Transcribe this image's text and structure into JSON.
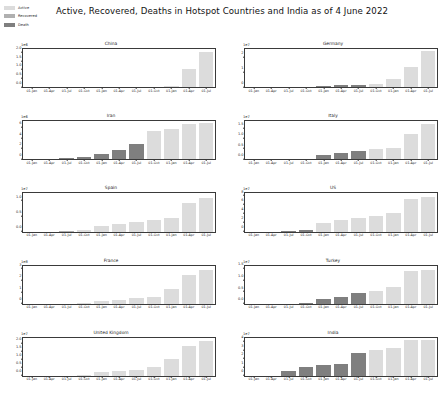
{
  "figure": {
    "title": "Active, Recovered, Deaths in Hotspot Countries and India as of 4 June 2022",
    "legend": [
      {
        "label": "Active",
        "color": "#dcdcdc",
        "name": "legend-active"
      },
      {
        "label": "Recovered",
        "color": "#b0b0b0",
        "name": "legend-recovered"
      },
      {
        "label": "Death",
        "color": "#7f7f7f",
        "name": "legend-death"
      }
    ],
    "layout": {
      "rows": 5,
      "cols": 2,
      "grid": false
    }
  },
  "chart_data": [
    {
      "type": "bar",
      "title": "China",
      "xlabel": "",
      "ylabel": "",
      "exponent": "1e6",
      "ylim": [
        0,
        2.2
      ],
      "yticks": [
        "0.0",
        "0.5",
        "1.0",
        "1.5",
        "2.0"
      ],
      "ytick_values": [
        0.0,
        0.5,
        1.0,
        1.5,
        2.0
      ],
      "x": [
        "01-Jan",
        "01-Apr",
        "01-Jul",
        "01-Oct",
        "01-Jan",
        "01-Apr",
        "01-Jul",
        "01-Oct",
        "01-Jan",
        "01-Apr",
        "01-Jul"
      ],
      "values": [
        0.01,
        0.02,
        0.02,
        0.03,
        0.03,
        0.03,
        0.04,
        0.04,
        0.05,
        1.05,
        2.05
      ],
      "colors": [
        "#b0b0b0",
        "#b0b0b0",
        "#b0b0b0",
        "#b0b0b0",
        "#b0b0b0",
        "#b0b0b0",
        "#b0b0b0",
        "#b0b0b0",
        "#dcdcdc",
        "#dcdcdc",
        "#dcdcdc"
      ]
    },
    {
      "type": "bar",
      "title": "Germany",
      "xlabel": "",
      "ylabel": "",
      "exponent": "1e7",
      "ylim": [
        0,
        2.6
      ],
      "yticks": [
        "0",
        "1",
        "2"
      ],
      "ytick_values": [
        0,
        1,
        2
      ],
      "x": [
        "01-Jan",
        "01-Apr",
        "01-Jul",
        "01-Oct",
        "01-Jan",
        "01-Apr",
        "01-Jul",
        "01-Oct",
        "01-Jan",
        "01-Apr",
        "01-Jul"
      ],
      "values": [
        0.0,
        0.0,
        0.01,
        0.02,
        0.08,
        0.12,
        0.18,
        0.25,
        0.55,
        1.35,
        2.45
      ],
      "colors": [
        "#b0b0b0",
        "#b0b0b0",
        "#b0b0b0",
        "#7f7f7f",
        "#7f7f7f",
        "#7f7f7f",
        "#7f7f7f",
        "#dcdcdc",
        "#dcdcdc",
        "#dcdcdc",
        "#dcdcdc"
      ]
    },
    {
      "type": "bar",
      "title": "Iran",
      "xlabel": "",
      "ylabel": "",
      "exponent": "1e6",
      "ylim": [
        0,
        7.2
      ],
      "yticks": [
        "0",
        "2",
        "4",
        "6"
      ],
      "ytick_values": [
        0,
        2,
        4,
        6
      ],
      "x": [
        "01-Jan",
        "01-Apr",
        "01-Jul",
        "01-Oct",
        "01-Jan",
        "01-Apr",
        "01-Jul",
        "01-Oct",
        "01-Jan",
        "01-Apr",
        "01-Jul"
      ],
      "values": [
        0.0,
        0.05,
        0.2,
        0.45,
        1.1,
        1.8,
        2.9,
        5.3,
        5.7,
        6.6,
        6.8
      ],
      "colors": [
        "#b0b0b0",
        "#7f7f7f",
        "#7f7f7f",
        "#7f7f7f",
        "#7f7f7f",
        "#7f7f7f",
        "#7f7f7f",
        "#dcdcdc",
        "#dcdcdc",
        "#dcdcdc",
        "#dcdcdc"
      ]
    },
    {
      "type": "bar",
      "title": "Italy",
      "xlabel": "",
      "ylabel": "",
      "exponent": "1e7",
      "ylim": [
        0,
        1.85
      ],
      "yticks": [
        "0.0",
        "0.5",
        "1.0",
        "1.5"
      ],
      "ytick_values": [
        0.0,
        0.5,
        1.0,
        1.5
      ],
      "x": [
        "01-Jan",
        "01-Apr",
        "01-Jul",
        "01-Oct",
        "01-Jan",
        "01-Apr",
        "01-Jul",
        "01-Oct",
        "01-Jan",
        "01-Apr",
        "01-Jul"
      ],
      "values": [
        0.0,
        0.0,
        0.01,
        0.03,
        0.22,
        0.33,
        0.42,
        0.5,
        0.55,
        1.25,
        1.7
      ],
      "colors": [
        "#b0b0b0",
        "#b0b0b0",
        "#b0b0b0",
        "#7f7f7f",
        "#7f7f7f",
        "#7f7f7f",
        "#7f7f7f",
        "#dcdcdc",
        "#dcdcdc",
        "#dcdcdc",
        "#dcdcdc"
      ]
    },
    {
      "type": "bar",
      "title": "Spain",
      "xlabel": "",
      "ylabel": "",
      "exponent": "1e7",
      "ylim": [
        0,
        1.25
      ],
      "yticks": [
        "0.0",
        "0.5",
        "1.0"
      ],
      "ytick_values": [
        0.0,
        0.5,
        1.0
      ],
      "x": [
        "01-Jan",
        "01-Apr",
        "01-Jul",
        "01-Oct",
        "01-Jan",
        "01-Apr",
        "01-Jul",
        "01-Oct",
        "01-Jan",
        "01-Apr",
        "01-Jul"
      ],
      "values": [
        0.0,
        0.0,
        0.01,
        0.06,
        0.17,
        0.24,
        0.3,
        0.38,
        0.43,
        0.95,
        1.1
      ],
      "colors": [
        "#b0b0b0",
        "#b0b0b0",
        "#b0b0b0",
        "#dcdcdc",
        "#dcdcdc",
        "#dcdcdc",
        "#dcdcdc",
        "#dcdcdc",
        "#dcdcdc",
        "#dcdcdc",
        "#dcdcdc"
      ]
    },
    {
      "type": "bar",
      "title": "US",
      "xlabel": "",
      "ylabel": "",
      "exponent": "1e7",
      "ylim": [
        0,
        8.6
      ],
      "yticks": [
        "0",
        "2",
        "4",
        "6",
        "8"
      ],
      "ytick_values": [
        0,
        2,
        4,
        6,
        8
      ],
      "x": [
        "01-Jan",
        "01-Apr",
        "01-Jul",
        "01-Oct",
        "01-Jan",
        "01-Apr",
        "01-Jul",
        "01-Oct",
        "01-Jan",
        "01-Apr",
        "01-Jul"
      ],
      "values": [
        0.0,
        0.0,
        0.1,
        0.25,
        1.9,
        2.7,
        3.1,
        3.6,
        4.1,
        7.3,
        7.9
      ],
      "colors": [
        "#b0b0b0",
        "#b0b0b0",
        "#7f7f7f",
        "#7f7f7f",
        "#dcdcdc",
        "#dcdcdc",
        "#dcdcdc",
        "#dcdcdc",
        "#dcdcdc",
        "#dcdcdc",
        "#dcdcdc"
      ]
    },
    {
      "type": "bar",
      "title": "France",
      "xlabel": "",
      "ylabel": "",
      "exponent": "1e8",
      "ylim": [
        0,
        3.3
      ],
      "yticks": [
        "0",
        "1",
        "2",
        "3"
      ],
      "ytick_values": [
        0,
        1,
        2,
        3
      ],
      "x": [
        "01-Jan",
        "01-Apr",
        "01-Jul",
        "01-Oct",
        "01-Jan",
        "01-Apr",
        "01-Jul",
        "01-Oct",
        "01-Jan",
        "01-Apr",
        "01-Jul"
      ],
      "values": [
        0.0,
        0.0,
        0.01,
        0.03,
        0.2,
        0.35,
        0.5,
        0.62,
        1.3,
        2.5,
        2.9
      ],
      "colors": [
        "#b0b0b0",
        "#b0b0b0",
        "#b0b0b0",
        "#dcdcdc",
        "#dcdcdc",
        "#dcdcdc",
        "#dcdcdc",
        "#dcdcdc",
        "#dcdcdc",
        "#dcdcdc",
        "#dcdcdc"
      ]
    },
    {
      "type": "bar",
      "title": "Turkey",
      "xlabel": "",
      "ylabel": "",
      "exponent": "1e7",
      "ylim": [
        0,
        1.62
      ],
      "yticks": [
        "0.0",
        "0.5",
        "1.0",
        "1.5"
      ],
      "ytick_values": [
        0.0,
        0.5,
        1.0,
        1.5
      ],
      "x": [
        "01-Jan",
        "01-Apr",
        "01-Jul",
        "01-Oct",
        "01-Jan",
        "01-Apr",
        "01-Jul",
        "01-Oct",
        "01-Jan",
        "01-Apr",
        "01-Jul"
      ],
      "values": [
        0.0,
        0.0,
        0.01,
        0.02,
        0.2,
        0.3,
        0.44,
        0.55,
        0.72,
        1.4,
        1.45
      ],
      "colors": [
        "#b0b0b0",
        "#b0b0b0",
        "#b0b0b0",
        "#7f7f7f",
        "#7f7f7f",
        "#7f7f7f",
        "#7f7f7f",
        "#dcdcdc",
        "#dcdcdc",
        "#dcdcdc",
        "#dcdcdc"
      ]
    },
    {
      "type": "bar",
      "title": "United Kingdom",
      "xlabel": "",
      "ylabel": "",
      "exponent": "1e7",
      "ylim": [
        0,
        2.35
      ],
      "yticks": [
        "0.0",
        "0.5",
        "1.0",
        "1.5",
        "2.0"
      ],
      "ytick_values": [
        0.0,
        0.5,
        1.0,
        1.5,
        2.0
      ],
      "x": [
        "01-Jan",
        "01-Apr",
        "01-Jul",
        "01-Oct",
        "01-Jan",
        "01-Apr",
        "01-Jul",
        "01-Oct",
        "01-Jan",
        "01-Apr",
        "01-Jul"
      ],
      "values": [
        0.0,
        0.0,
        0.01,
        0.05,
        0.22,
        0.3,
        0.35,
        0.55,
        1.05,
        1.85,
        2.15
      ],
      "colors": [
        "#b0b0b0",
        "#b0b0b0",
        "#b0b0b0",
        "#dcdcdc",
        "#dcdcdc",
        "#dcdcdc",
        "#dcdcdc",
        "#dcdcdc",
        "#dcdcdc",
        "#dcdcdc",
        "#dcdcdc"
      ]
    },
    {
      "type": "bar",
      "title": "India",
      "xlabel": "",
      "ylabel": "",
      "exponent": "1e7",
      "ylim": [
        0,
        4.45
      ],
      "yticks": [
        "0",
        "1",
        "2",
        "3",
        "4"
      ],
      "ytick_values": [
        0,
        1,
        2,
        3,
        4
      ],
      "x": [
        "01-Jan",
        "01-Apr",
        "01-Jul",
        "01-Oct",
        "01-Jan",
        "01-Apr",
        "01-Jul",
        "01-Oct",
        "01-Jan",
        "01-Apr",
        "01-Jul"
      ],
      "values": [
        0.0,
        0.02,
        0.55,
        1.1,
        1.3,
        1.4,
        2.65,
        3.05,
        3.25,
        4.15,
        4.25
      ],
      "colors": [
        "#b0b0b0",
        "#7f7f7f",
        "#7f7f7f",
        "#7f7f7f",
        "#7f7f7f",
        "#7f7f7f",
        "#7f7f7f",
        "#dcdcdc",
        "#dcdcdc",
        "#dcdcdc",
        "#dcdcdc"
      ]
    }
  ]
}
